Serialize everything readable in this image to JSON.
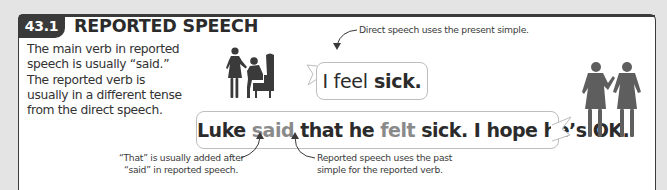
{
  "section": {
    "number": "43.1",
    "title": "REPORTED SPEECH"
  },
  "intro": {
    "lines": [
      "The main verb in reported",
      "speech is usually “said.”",
      "The reported verb is",
      "usually in a different tense",
      "from the direct speech."
    ]
  },
  "direct_speech": {
    "part1": "I feel",
    "part2": "sick."
  },
  "reported_speech": {
    "w1": "Luke",
    "w2": "said",
    "w3": "that he",
    "w4": "felt",
    "w5": "sick. I hope he’s OK."
  },
  "annotations": {
    "top": "Direct speech uses the present simple.",
    "left_line1": "“That” is usually added after",
    "left_line2": "“said” in reported speech.",
    "right_line1": "Reported speech uses the past",
    "right_line2": "simple for the reported verb."
  },
  "colors": {
    "dark": "#3a3a3a",
    "highlight_gray": "#8a8a8a",
    "background": "#e4e4e4"
  },
  "icons": {
    "left_figures": "woman-standing-and-sick-man-in-armchair",
    "right_figures": "two-women-talking"
  }
}
